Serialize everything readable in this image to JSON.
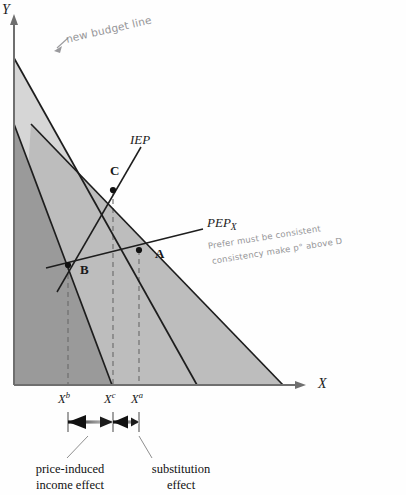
{
  "figure": {
    "type": "economics-budget-line-diagram",
    "axes": {
      "y_label": "Y",
      "x_label": "X"
    },
    "curves": [
      {
        "id": "iep",
        "label": "IEP",
        "label_sub": ""
      },
      {
        "id": "pep",
        "label": "PEP",
        "label_sub": "X"
      }
    ],
    "points": [
      {
        "id": "A",
        "label": "A"
      },
      {
        "id": "B",
        "label": "B"
      },
      {
        "id": "C",
        "label": "C"
      }
    ],
    "x_ticks": [
      {
        "id": "xb",
        "base": "X",
        "sup": "b"
      },
      {
        "id": "xc",
        "base": "X",
        "sup": "c"
      },
      {
        "id": "xa",
        "base": "X",
        "sup": "a"
      }
    ],
    "effects": [
      {
        "id": "income",
        "line1": "price-induced",
        "line2": "income effect"
      },
      {
        "id": "substitution",
        "line1": "substitution",
        "line2": "effect"
      }
    ],
    "annotations": [
      {
        "id": "new-budget-line",
        "text": "new budget line"
      },
      {
        "id": "note-line-1",
        "text": "Prefer  must be consistent"
      },
      {
        "id": "note-line-2",
        "text": "consistency make p° above D"
      }
    ],
    "colors": {
      "shade_light": "#d6d6d6",
      "shade_mid": "#bdbdbd",
      "shade_dark": "#9a9a9a",
      "line": "#1d1d1d",
      "axis": "#6f6f6f",
      "dash": "#6a6a6a",
      "pencil": "#8d8d90"
    }
  }
}
